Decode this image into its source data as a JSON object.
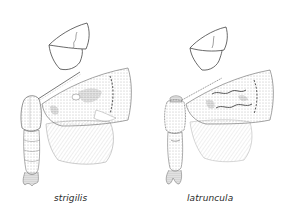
{
  "plate": {
    "background": "#ffffff",
    "ink_color": "#3a3a3a",
    "figures": [
      {
        "id": "left",
        "species_label": "strigilis",
        "elements": [
          "wing-outline-sketch",
          "moth-body",
          "forewing",
          "hindwing",
          "antenna"
        ]
      },
      {
        "id": "right",
        "species_label": "latruncula",
        "elements": [
          "wing-outline-sketch",
          "moth-body",
          "forewing",
          "hindwing",
          "antenna"
        ]
      }
    ]
  }
}
